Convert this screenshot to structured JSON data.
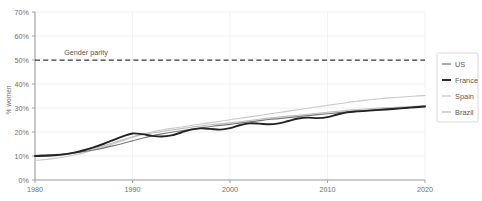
{
  "chart_data": {
    "type": "line",
    "title": "",
    "xlabel": "",
    "ylabel": "% women",
    "xlim": [
      1980,
      2020
    ],
    "ylim": [
      0,
      70
    ],
    "grid": true,
    "legend_position": "right",
    "x_ticks": [
      "1980",
      "1990",
      "2000",
      "2010",
      "2020"
    ],
    "x_tick_values": [
      1980,
      1990,
      2000,
      2010,
      2020
    ],
    "y_ticks": [
      "0%",
      "10%",
      "20%",
      "30%",
      "40%",
      "50%",
      "60%",
      "70%"
    ],
    "y_tick_values": [
      0,
      10,
      20,
      30,
      40,
      50,
      60,
      70
    ],
    "annotations": [
      {
        "text": "Gender parity",
        "x": 1983,
        "y": 52,
        "kind": "reference-line-label"
      }
    ],
    "reference_lines": [
      {
        "label": "Gender parity",
        "y": 50,
        "style": "dashed",
        "color": "#3d3d3d"
      }
    ],
    "x": [
      1980,
      1981,
      1982,
      1983,
      1984,
      1985,
      1986,
      1987,
      1988,
      1989,
      1990,
      1991,
      1992,
      1993,
      1994,
      1995,
      1996,
      1997,
      1998,
      1999,
      2000,
      2001,
      2002,
      2003,
      2004,
      2005,
      2006,
      2007,
      2008,
      2009,
      2010,
      2011,
      2012,
      2013,
      2014,
      2015,
      2016,
      2017,
      2018,
      2019,
      2020
    ],
    "series": [
      {
        "name": "US",
        "color": "#7a7a7a",
        "width": 1.2,
        "dash": "",
        "values": [
          10.2,
          10.4,
          10.6,
          10.9,
          11.3,
          11.8,
          12.5,
          13.3,
          14.2,
          15.2,
          16.3,
          17.4,
          18.4,
          19.2,
          19.9,
          20.5,
          21.1,
          21.7,
          22.3,
          22.8,
          23.2,
          23.7,
          24.2,
          24.7,
          25.2,
          25.6,
          26.0,
          26.4,
          26.8,
          27.2,
          27.6,
          28.0,
          28.4,
          28.7,
          29.0,
          29.3,
          29.6,
          29.9,
          30.2,
          30.5,
          30.8
        ]
      },
      {
        "name": "France",
        "color": "#232323",
        "width": 1.9,
        "dash": "",
        "values": [
          10.0,
          10.1,
          10.3,
          10.7,
          11.4,
          12.4,
          13.6,
          15.0,
          16.6,
          18.2,
          19.4,
          19.1,
          18.4,
          18.1,
          18.6,
          19.8,
          21.0,
          21.5,
          21.3,
          21.0,
          21.6,
          22.8,
          23.6,
          23.5,
          23.2,
          23.6,
          24.6,
          25.6,
          26.0,
          25.8,
          26.2,
          27.3,
          28.2,
          28.6,
          28.8,
          29.1,
          29.4,
          29.7,
          30.0,
          30.3,
          30.6
        ]
      },
      {
        "name": "Spain",
        "color": "#c9c9c9",
        "width": 1.1,
        "dash": "",
        "values": [
          8.2,
          8.5,
          9.0,
          9.6,
          10.4,
          11.3,
          12.4,
          13.6,
          15.0,
          16.4,
          17.8,
          19.0,
          20.0,
          20.8,
          21.5,
          22.1,
          22.7,
          23.3,
          23.9,
          24.5,
          25.1,
          25.7,
          26.3,
          26.9,
          27.5,
          28.1,
          28.7,
          29.3,
          29.9,
          30.5,
          31.1,
          31.7,
          32.3,
          32.8,
          33.3,
          33.7,
          34.1,
          34.4,
          34.7,
          35.0,
          35.2
        ]
      },
      {
        "name": "Brazil",
        "color": "#bdbdbd",
        "width": 1.1,
        "dash": "",
        "values": [
          9.8,
          10.0,
          10.2,
          10.6,
          11.2,
          12.0,
          13.0,
          14.2,
          15.5,
          16.8,
          18.0,
          18.9,
          19.6,
          20.2,
          20.8,
          21.4,
          22.0,
          22.5,
          23.0,
          23.4,
          23.8,
          24.3,
          24.8,
          25.3,
          25.8,
          26.2,
          26.6,
          27.0,
          27.4,
          27.8,
          28.2,
          28.6,
          29.0,
          29.3,
          29.6,
          29.9,
          30.1,
          30.3,
          30.5,
          30.7,
          30.9
        ]
      }
    ]
  },
  "legend": {
    "items": [
      {
        "label": "US"
      },
      {
        "label": "France"
      },
      {
        "label": "Spain"
      },
      {
        "label": "Brazil"
      }
    ]
  }
}
